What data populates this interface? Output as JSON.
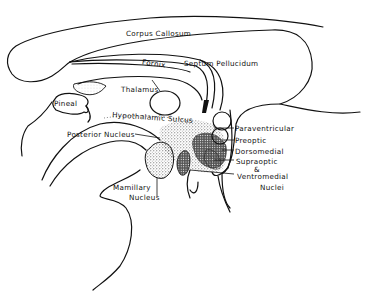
{
  "diagram": {
    "labels": {
      "corpus_callosum": "Corpus  Callosum",
      "fornix": "Fornix",
      "septum_pellucidum": "Septum  Pellucidum",
      "thalamus": "Thalamus",
      "pineal": "Pineal",
      "hypothalamic_sulcus": "Hypothalamic Sulcus",
      "posterior_nucleus": "Posterior  Nucleus",
      "paraventricular": "Paraventricular",
      "preoptic": "Preoptic",
      "dorsomedial": "Dorsomedial",
      "supraoptic": "Supraoptic",
      "ampersand": "&",
      "ventromedial": "Ventromedial",
      "nuclei": "Nuclei",
      "mamillary": "Mamillary",
      "nucleus": "Nucleus"
    },
    "colors": {
      "line": "#111111",
      "background": "#ffffff",
      "stipple": "#333333"
    }
  }
}
